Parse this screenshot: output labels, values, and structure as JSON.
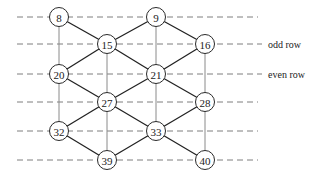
{
  "diagram": {
    "rows": [
      "row1",
      "row2",
      "row3",
      "row4",
      "row5",
      "row6"
    ],
    "row_labels": [
      {
        "row": 1,
        "text": "odd row"
      },
      {
        "row": 2,
        "text": "even row"
      }
    ],
    "columns": [
      "col0",
      "col1",
      "col2",
      "col3"
    ],
    "nodes": [
      {
        "id": "8",
        "row": 0,
        "col": 0
      },
      {
        "id": "9",
        "row": 0,
        "col": 2
      },
      {
        "id": "15",
        "row": 1,
        "col": 1
      },
      {
        "id": "16",
        "row": 1,
        "col": 3
      },
      {
        "id": "20",
        "row": 2,
        "col": 0
      },
      {
        "id": "21",
        "row": 2,
        "col": 2
      },
      {
        "id": "27",
        "row": 3,
        "col": 1
      },
      {
        "id": "28",
        "row": 3,
        "col": 3
      },
      {
        "id": "32",
        "row": 4,
        "col": 0
      },
      {
        "id": "33",
        "row": 4,
        "col": 2
      },
      {
        "id": "39",
        "row": 5,
        "col": 1
      },
      {
        "id": "40",
        "row": 5,
        "col": 3
      }
    ],
    "vertical_links": [
      [
        "8",
        "20"
      ],
      [
        "20",
        "32"
      ],
      [
        "15",
        "27"
      ],
      [
        "27",
        "39"
      ],
      [
        "9",
        "21"
      ],
      [
        "21",
        "33"
      ],
      [
        "16",
        "28"
      ],
      [
        "28",
        "40"
      ]
    ],
    "edges": [
      [
        "8",
        "15"
      ],
      [
        "15",
        "9"
      ],
      [
        "15",
        "20"
      ],
      [
        "15",
        "21"
      ],
      [
        "9",
        "16"
      ],
      [
        "16",
        "21"
      ],
      [
        "20",
        "27"
      ],
      [
        "21",
        "27"
      ],
      [
        "21",
        "28"
      ],
      [
        "27",
        "32"
      ],
      [
        "27",
        "33"
      ],
      [
        "28",
        "33"
      ],
      [
        "32",
        "39"
      ],
      [
        "33",
        "39"
      ],
      [
        "33",
        "40"
      ]
    ]
  }
}
